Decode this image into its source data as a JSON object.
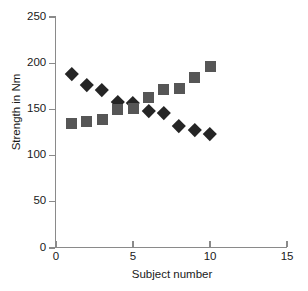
{
  "chart_data": {
    "type": "scatter",
    "title": "",
    "xlabel": "Subject number",
    "ylabel": "Strength in Nm",
    "xlim": [
      0,
      15
    ],
    "ylim": [
      0,
      250
    ],
    "xticks": [
      0,
      5,
      10,
      15
    ],
    "yticks": [
      0,
      50,
      100,
      150,
      200,
      250
    ],
    "xtick_labels": [
      "0",
      "5",
      "10",
      "15"
    ],
    "ytick_labels": [
      "0",
      "50",
      "100",
      "150",
      "200",
      "250"
    ],
    "grid": false,
    "legend": "none",
    "x": [
      1,
      2,
      3,
      4,
      5,
      6,
      7,
      8,
      9,
      10
    ],
    "series": [
      {
        "name": "diamond-series",
        "marker": "diamond",
        "color": "#252525",
        "values": [
          189,
          177,
          171,
          158,
          157,
          149,
          146,
          132,
          128,
          124
        ]
      },
      {
        "name": "square-series",
        "marker": "square",
        "color": "#565656",
        "values": [
          135,
          137,
          139,
          150,
          151,
          163,
          171,
          173,
          185,
          196
        ]
      }
    ]
  },
  "axes": {
    "axis_color": "#8a8a8a",
    "text_color": "#1a1a1a"
  }
}
